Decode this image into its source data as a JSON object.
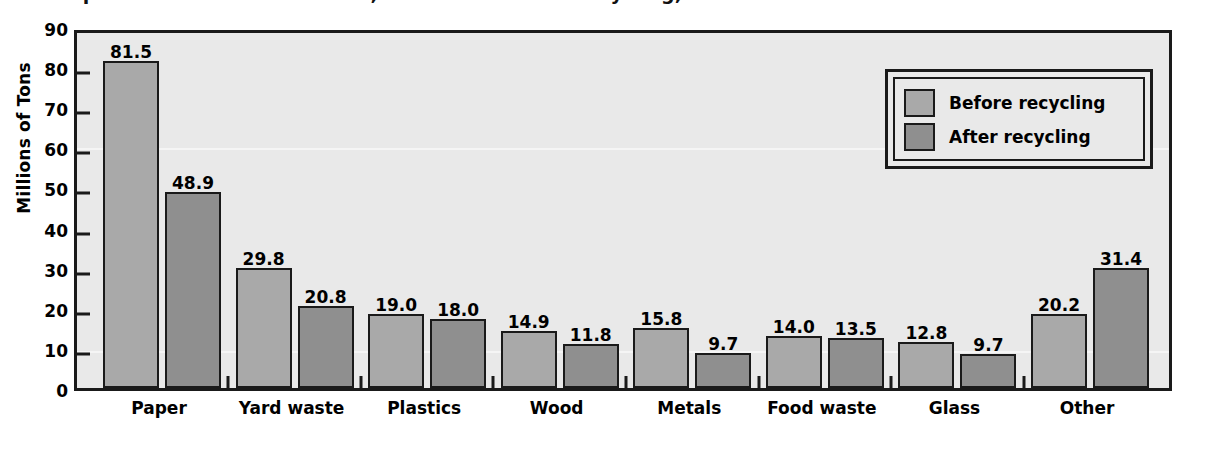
{
  "figure": {
    "title_cropped": "Municipal Solid Waste Generated, Before and After Recycling, 1999",
    "source_note": "Source: EPA 2000"
  },
  "legend": {
    "position": "upper-right",
    "entries": [
      {
        "label": "Before recycling",
        "color": "#a9a9a9"
      },
      {
        "label": "After recycling",
        "color": "#8f8f8f"
      }
    ]
  },
  "colors": {
    "before_bar": "#a9a9a9",
    "after_bar": "#8f8f8f",
    "plot_background": "#e9e9e9",
    "frame": "#1a1a1a",
    "page_background": "#ffffff"
  },
  "chart_data": {
    "type": "bar",
    "title": "Municipal Solid Waste Generated, Before and After Recycling, 1999",
    "xlabel": "",
    "ylabel": "Millions of Tons",
    "ylim": [
      0,
      90
    ],
    "yticks": [
      0,
      10,
      20,
      30,
      40,
      50,
      60,
      70,
      80,
      90
    ],
    "ytick_labels": [
      "0",
      "10",
      "20",
      "30",
      "40",
      "50",
      "60",
      "70",
      "80",
      "90"
    ],
    "grid": false,
    "legend_position": "upper right",
    "categories": [
      "Paper",
      "Yard waste",
      "Plastics",
      "Wood",
      "Metals",
      "Food waste",
      "Glass",
      "Other"
    ],
    "series": [
      {
        "name": "Before recycling",
        "color": "#a9a9a9",
        "values": [
          81.5,
          29.8,
          19.0,
          14.9,
          15.8,
          14.0,
          12.8,
          20.2
        ],
        "value_labels": [
          "81.5",
          "29.8",
          "19.0",
          "14.9",
          "15.8",
          "14.0",
          "12.8",
          "20.2"
        ]
      },
      {
        "name": "After recycling",
        "color": "#8f8f8f",
        "values": [
          48.9,
          20.8,
          18.0,
          11.8,
          9.7,
          13.5,
          9.7,
          31.4
        ],
        "value_labels": [
          "48.9",
          "20.8",
          "18.0",
          "11.8",
          "9.7",
          "13.5",
          "9.7",
          "31.4"
        ]
      }
    ],
    "bar_pixel_heights": {
      "before": [
        81.5,
        29.8,
        18.5,
        14.2,
        14.9,
        13.0,
        11.5,
        18.5
      ],
      "after": [
        48.9,
        20.5,
        17.3,
        11.0,
        8.8,
        12.4,
        8.4,
        29.8
      ]
    },
    "annotations": [
      "Value labels are printed above each bar.",
      "For the 'Other' category the drawn bars do not match the printed order: the darker 'after recycling' bar is taller than the lighter 'before recycling' bar."
    ]
  }
}
